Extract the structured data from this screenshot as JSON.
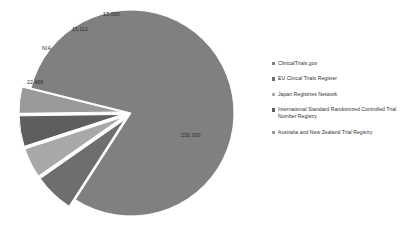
{
  "chart_data": {
    "type": "pie",
    "title": "",
    "subtitle": "",
    "xlabel": "",
    "ylabel": "",
    "grid": false,
    "legend_position": "right",
    "exploded": true,
    "categories": [
      "ClinicalTrials.gov",
      "EU Clincal Trials Register",
      "Japan Registries Network",
      "International Standard Randomized Controlled Trial Number Registry",
      "Australia and New Zealand Trial Registry"
    ],
    "values": [
      230300,
      22466,
      null,
      15112,
      13000
    ],
    "data_labels": [
      "230,300",
      "22,466",
      "N/A",
      "15,112",
      "13,000"
    ],
    "colors": [
      "#808080",
      "#6e6e6e",
      "#a8a8a8",
      "#5e5e5e",
      "#9a9a9a"
    ]
  },
  "legend": {
    "items": [
      {
        "label": "ClinicalTrials.gov",
        "color": "#808080"
      },
      {
        "label": "EU Clincal Trials Register",
        "color": "#6e6e6e"
      },
      {
        "label": "Japan Registries Network",
        "color": "#a8a8a8"
      },
      {
        "label": "International Standard Randomized Controlled Trial Number Registry",
        "color": "#5e5e5e"
      },
      {
        "label": "Australia and New Zealand Trial Registry",
        "color": "#9a9a9a"
      }
    ]
  }
}
